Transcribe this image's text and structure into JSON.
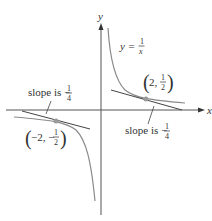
{
  "diagram": {
    "axes": {
      "x_label": "x",
      "y_label": "y"
    },
    "curve": {
      "equation_lhs": "y =",
      "frac_num": "1",
      "frac_den": "x",
      "color": "#8a8a8a"
    },
    "points": [
      {
        "label_prefix": "(2,",
        "frac_num": "1",
        "frac_den": "2",
        "label_suffix": ")",
        "x": 2,
        "y": 0.5
      },
      {
        "label_prefix": "(−2, −",
        "frac_num": "1",
        "frac_den": "2",
        "label_suffix": ")",
        "x": -2,
        "y": -0.5
      }
    ],
    "tangent_annotations": [
      {
        "text": "slope is −",
        "frac_num": "1",
        "frac_den": "4"
      },
      {
        "text": "slope is −",
        "frac_num": "1",
        "frac_den": "4"
      }
    ],
    "colors": {
      "axis": "#555555",
      "tangent": "#444444",
      "curve": "#8a8a8a",
      "point": "#9a9a9a"
    }
  }
}
